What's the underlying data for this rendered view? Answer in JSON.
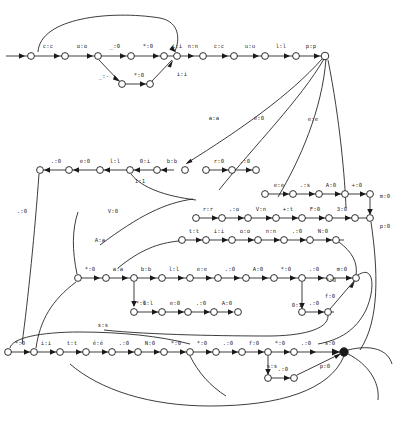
{
  "diagram": {
    "type": "finite-state-transducer",
    "width": 410,
    "height": 422,
    "colors": {
      "background": "#ffffff",
      "stroke": "#1a1a1a",
      "label": "#2a2a2a",
      "final_state_fill": "#1a1a1a"
    },
    "rows": {
      "row1_labels": [
        "c:c",
        "o:o",
        "_:0",
        "*:0",
        "i:i",
        "n:n",
        "c:c",
        "u:u",
        "l:l",
        "p:p"
      ],
      "row1_sub_labels": [
        "_:-",
        "*:0",
        "i:i"
      ],
      "row2_labels": [
        ".:0",
        "e:0",
        "l:l",
        "0:i",
        "b:b"
      ],
      "row2_mid_labels": [
        "r:0",
        ".:0"
      ],
      "row2_right_labels": [
        "e:e",
        ".:s",
        "A:0",
        "+:0"
      ],
      "row3_labels": [
        "r:r",
        ".:o",
        "V:n",
        "+:t",
        "F:0",
        "3:0"
      ],
      "row4_labels": [
        "t:t",
        "i:i",
        "o:o",
        "n:n",
        ".:0",
        "N:0"
      ],
      "row5_labels": [
        "*:0",
        "a:a",
        "b:b",
        "l:l",
        "e:e",
        ".:0",
        "A:0",
        "*:0",
        ".:0",
        "m:0"
      ],
      "row6_labels": [
        "l:l",
        "e:0",
        ".:0",
        "A:0"
      ],
      "row6_right_labels": [
        ".:0",
        "f:0"
      ],
      "row7_labels": [
        "*:0",
        "i:i",
        "t:t",
        "é:é",
        ".:0",
        "N:0",
        "*:0",
        "*:0",
        ".:0",
        "f:0",
        "*:0",
        ".:0",
        "s:0"
      ],
      "row7_sub_labels": [
        ".:0"
      ]
    },
    "free_labels": [
      {
        "id": "lbl-aa",
        "text": "a:a",
        "x": 214,
        "y": 118
      },
      {
        "id": "lbl-e0",
        "text": "e:0",
        "x": 259,
        "y": 118
      },
      {
        "id": "lbl-ee",
        "text": "e:e",
        "x": 313,
        "y": 119
      },
      {
        "id": "lbl-dot0-left",
        "text": ".:0",
        "x": 22,
        "y": 211
      },
      {
        "id": "lbl-ll-mid",
        "text": "1:1",
        "x": 140,
        "y": 181
      },
      {
        "id": "lbl-V0",
        "text": "V:0",
        "x": 113,
        "y": 211
      },
      {
        "id": "lbl-Aa",
        "text": "A:a",
        "x": 100,
        "y": 240
      },
      {
        "id": "lbl-m0-right",
        "text": "m:0",
        "x": 385,
        "y": 196
      },
      {
        "id": "lbl-p0-right",
        "text": "p:0",
        "x": 385,
        "y": 226
      },
      {
        "id": "lbl-E0",
        "text": "E:0",
        "x": 297,
        "y": 305
      },
      {
        "id": "lbl-0i",
        "text": "0:i",
        "x": 141,
        "y": 303
      },
      {
        "id": "lbl-star0-mid",
        "text": "*:0",
        "x": 103,
        "y": 325
      },
      {
        "id": "lbl-ss",
        "text": "s:s",
        "x": 325,
        "y": 366
      },
      {
        "id": "lbl-p0-bottom",
        "text": "p:0",
        "x": 325,
        "y": 379
      },
      {
        "id": "lbl-star0-upper",
        "text": "*:0",
        "x": 331,
        "y": 280
      }
    ],
    "node_count": 72,
    "title": ""
  }
}
